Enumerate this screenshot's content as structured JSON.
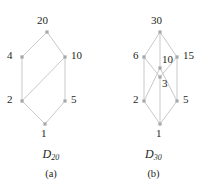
{
  "figure": {
    "edge_color": "#c9c9c9",
    "node_color": "#a8a8a8",
    "text_color": "#231f20",
    "background": "#ffffff"
  },
  "panels": [
    {
      "id": "a",
      "panel_label": "(a)",
      "poset_name": "D",
      "poset_subscript": "20",
      "nodes": [
        {
          "label": "20",
          "x": 47,
          "y": 32,
          "label_x": 37,
          "label_y": 15,
          "label_align": "top"
        },
        {
          "label": "4",
          "x": 22,
          "y": 57,
          "label_x": 7,
          "label_y": 50,
          "label_align": "left"
        },
        {
          "label": "10",
          "x": 65,
          "y": 57,
          "label_x": 71,
          "label_y": 50,
          "label_align": "right"
        },
        {
          "label": "2",
          "x": 22,
          "y": 101,
          "label_x": 7,
          "label_y": 94,
          "label_align": "left"
        },
        {
          "label": "5",
          "x": 65,
          "y": 101,
          "label_x": 71,
          "label_y": 94,
          "label_align": "right"
        },
        {
          "label": "1",
          "x": 45,
          "y": 124,
          "label_x": 41,
          "label_y": 128,
          "label_align": "bottom"
        }
      ],
      "edges": [
        {
          "from": "20",
          "to": "4"
        },
        {
          "from": "20",
          "to": "10"
        },
        {
          "from": "4",
          "to": "2"
        },
        {
          "from": "10",
          "to": "2"
        },
        {
          "from": "10",
          "to": "5"
        },
        {
          "from": "2",
          "to": "1"
        },
        {
          "from": "5",
          "to": "1"
        }
      ],
      "caption_y": 148,
      "panel_label_y": 169
    },
    {
      "id": "b",
      "panel_label": "(b)",
      "poset_name": "D",
      "poset_subscript": "30",
      "nodes": [
        {
          "label": "30",
          "x": 58,
          "y": 32,
          "label_x": 49,
          "label_y": 15,
          "label_align": "top"
        },
        {
          "label": "6",
          "x": 42,
          "y": 57,
          "label_x": 31,
          "label_y": 50,
          "label_align": "left"
        },
        {
          "label": "15",
          "x": 75,
          "y": 57,
          "label_x": 81,
          "label_y": 50,
          "label_align": "right"
        },
        {
          "label": "10",
          "x": 58,
          "y": 68,
          "label_x": 60,
          "label_y": 54,
          "label_align": "top-right"
        },
        {
          "label": "3",
          "x": 58,
          "y": 77,
          "label_x": 60,
          "label_y": 78,
          "label_align": "bottom-right"
        },
        {
          "label": "2",
          "x": 42,
          "y": 101,
          "label_x": 31,
          "label_y": 94,
          "label_align": "left"
        },
        {
          "label": "5",
          "x": 75,
          "y": 101,
          "label_x": 81,
          "label_y": 94,
          "label_align": "right"
        },
        {
          "label": "1",
          "x": 58,
          "y": 124,
          "label_x": 54,
          "label_y": 128,
          "label_align": "bottom"
        }
      ],
      "edges": [
        {
          "from": "30",
          "to": "6"
        },
        {
          "from": "30",
          "to": "15"
        },
        {
          "from": "30",
          "to": "10"
        },
        {
          "from": "6",
          "to": "2"
        },
        {
          "from": "6",
          "to": "3"
        },
        {
          "from": "15",
          "to": "3"
        },
        {
          "from": "15",
          "to": "5"
        },
        {
          "from": "10",
          "to": "2"
        },
        {
          "from": "10",
          "to": "5"
        },
        {
          "from": "2",
          "to": "1"
        },
        {
          "from": "3",
          "to": "1"
        },
        {
          "from": "5",
          "to": "1"
        }
      ],
      "caption_y": 148,
      "panel_label_y": 169
    }
  ]
}
